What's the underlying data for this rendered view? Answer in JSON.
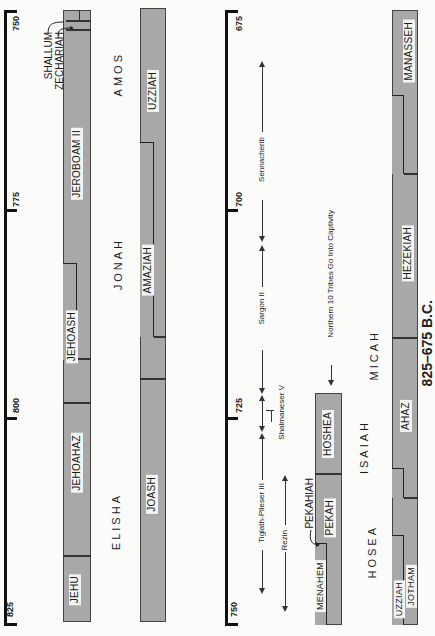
{
  "title_caption": "825–675 B.C.",
  "panel_left": {
    "axis_ticks": [
      "750",
      "775",
      "800",
      "825"
    ],
    "israel_kings": [
      "SHALLUM",
      "ZECHARIAH",
      "JEROBOAM II",
      "JEHOASH",
      "JEHOAHAZ",
      "JEHU"
    ],
    "judah_kings": [
      "UZZIAH",
      "AMAZIAH",
      "JOASH"
    ],
    "prophets": [
      "AMOS",
      "JONAH",
      "ELISHA"
    ]
  },
  "panel_right": {
    "axis_ticks": [
      "675",
      "700",
      "725",
      "750"
    ],
    "assyrian_kings": [
      "Sennacherib",
      "Sargon II",
      "Shalmaneser V",
      "Tiglath-Pileser III"
    ],
    "syrian_king": "Rezin",
    "event": "Northern 10 Tribes Go Into Captivity",
    "israel_kings": [
      "HOSHEA",
      "PEKAH",
      "PEKAHIAH",
      "MENAHEM"
    ],
    "judah_kings": [
      "MANASSEH",
      "HEZEKIAH",
      "AHAZ",
      "JOTHAM",
      "UZZIAH"
    ],
    "prophets": [
      "MICAH",
      "ISAIAH",
      "HOSEA"
    ]
  },
  "colors": {
    "bar_fill": "#a8a8a8",
    "label_bg": "#f4f4f2",
    "line": "#111111"
  }
}
